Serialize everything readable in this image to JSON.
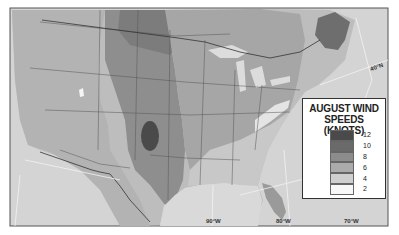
{
  "legend": {
    "title_line1": "AUGUST WIND",
    "title_line2": "SPEEDS (KNOTS)",
    "items": [
      {
        "label": "12",
        "color": "#4a4a4a"
      },
      {
        "label": "10",
        "color": "#6a6a6a"
      },
      {
        "label": "8",
        "color": "#8c8c8c"
      },
      {
        "label": "6",
        "color": "#ababab"
      },
      {
        "label": "4",
        "color": "#cfcfcf"
      },
      {
        "label": "2",
        "color": "#f7f7f7"
      }
    ]
  },
  "graticule_labels": {
    "lon_90": "90°W",
    "lon_80": "80°W",
    "lon_70": "70°W",
    "lat_40": "40°N"
  },
  "colors": {
    "frame": "#555555",
    "ocean": "#d6d6d6",
    "terrain": "#b9b9b9",
    "plains_band": "#8f8f8f",
    "midwest": "#a6a6a6",
    "southeast": "#c8c8c8",
    "core_high": "#4a4a4a"
  }
}
